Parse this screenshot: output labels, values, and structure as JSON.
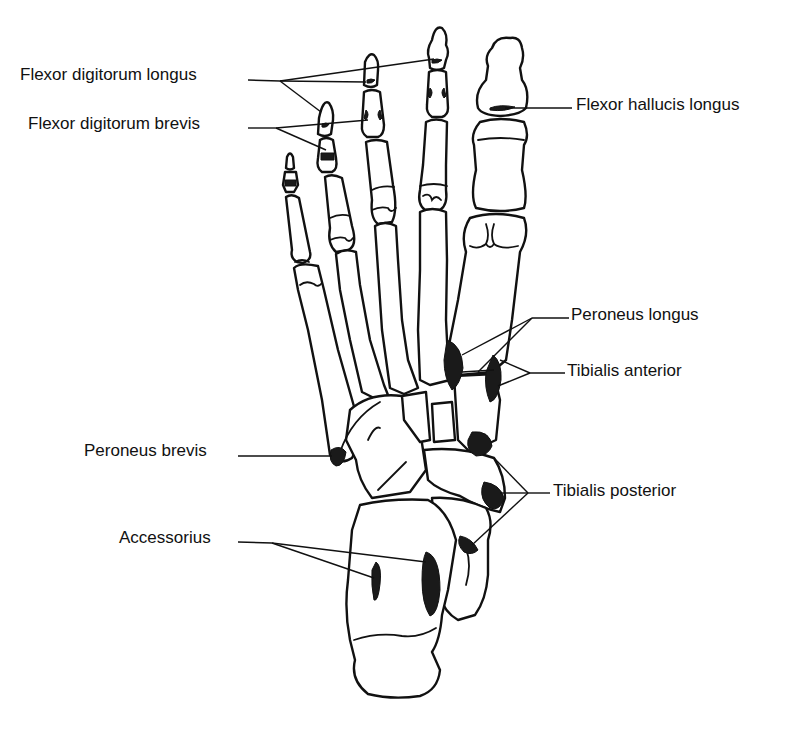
{
  "figure": {
    "colors": {
      "line": "#111111",
      "attachment": "#1a1a1a",
      "background": "#ffffff"
    }
  },
  "labels": [
    {
      "id": "flexor-digitorum-longus",
      "text": "Flexor digitorum longus",
      "x": 20,
      "y": 61,
      "side": "left"
    },
    {
      "id": "flexor-digitorum-brevis",
      "text": "Flexor digitorum brevis",
      "x": 28,
      "y": 112,
      "side": "left"
    },
    {
      "id": "flexor-hallucis-longus",
      "text": "Flexor hallucis longus",
      "x": 576,
      "y": 95,
      "side": "right"
    },
    {
      "id": "peroneus-longus",
      "text": "Peroneus longus",
      "x": 571,
      "y": 305,
      "side": "right"
    },
    {
      "id": "tibialis-anterior",
      "text": "Tibialis anterior",
      "x": 567,
      "y": 361,
      "side": "right"
    },
    {
      "id": "peroneus-brevis",
      "text": "Peroneus brevis",
      "x": 84,
      "y": 439,
      "side": "left"
    },
    {
      "id": "tibialis-posterior",
      "text": "Tibialis posterior",
      "x": 553,
      "y": 481,
      "side": "right"
    },
    {
      "id": "accessorius",
      "text": "Accessorius",
      "x": 119,
      "y": 527,
      "side": "left"
    }
  ]
}
